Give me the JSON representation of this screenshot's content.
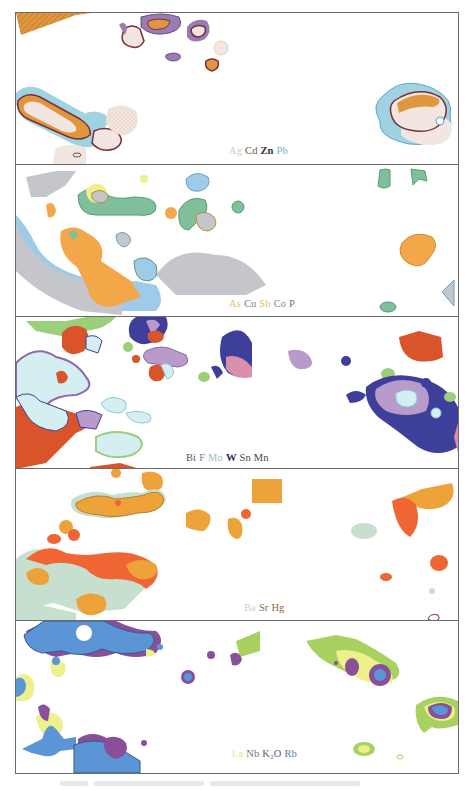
{
  "figure": {
    "panels": [
      {
        "id": "panel-1",
        "legend": [
          {
            "label": "Ag",
            "color": "#d9c9c4"
          },
          {
            "label": "Cd",
            "color": "#6a5a52"
          },
          {
            "label": "Zn",
            "color": "#3d3230"
          },
          {
            "label": "Pb",
            "color": "#6fb3c8"
          }
        ],
        "colors": {
          "orange": "#e0963f",
          "purple": "#9b7bb3",
          "cream": "#f3e5df",
          "cyan": "#9fd3e2",
          "outline": "#7a2d3a"
        }
      },
      {
        "id": "panel-2",
        "legend": [
          {
            "label": "As",
            "color": "#e7c36a"
          },
          {
            "label": "Cu",
            "color": "#7a7f86"
          },
          {
            "label": "Sb",
            "color": "#e3c25a"
          },
          {
            "label": "Co",
            "color": "#7f8a92"
          },
          {
            "label": "P",
            "color": "#6e7378"
          }
        ],
        "colors": {
          "orange": "#f3a748",
          "green": "#7fbf99",
          "gray": "#c4c6cb",
          "blue": "#9dcbe8",
          "yellow": "#eef08a"
        }
      },
      {
        "id": "panel-3",
        "legend": [
          {
            "label": "Bi",
            "color": "#555a6e"
          },
          {
            "label": "F",
            "color": "#6d7f9a"
          },
          {
            "label": "Mo",
            "color": "#9ab8c9"
          },
          {
            "label": "W",
            "color": "#2f2f5a"
          },
          {
            "label": "Sn",
            "color": "#4b3f48"
          },
          {
            "label": "Mn",
            "color": "#4b3f48"
          }
        ],
        "colors": {
          "red": "#d9542a",
          "green": "#9bcf7a",
          "purple": "#b89acb",
          "navy": "#3d3f9a",
          "pink": "#d98fae",
          "lightcyan": "#d5eef2"
        }
      },
      {
        "id": "panel-4",
        "legend": [
          {
            "label": "Ba",
            "color": "#e1cbb8"
          },
          {
            "label": "Sr",
            "color": "#8b6b4a"
          },
          {
            "label": "Hg",
            "color": "#8b6b4a"
          }
        ],
        "colors": {
          "orange": "#eea23a",
          "red": "#ef6634",
          "sage": "#c7dfcf"
        }
      },
      {
        "id": "panel-5",
        "legend": [
          {
            "label": "La",
            "color": "#e6e68c"
          },
          {
            "label": "Nb",
            "color": "#6b7f5a"
          },
          {
            "label": "K₂O",
            "color": "#5a5f7a"
          },
          {
            "label": "Rb",
            "color": "#4f7fb8"
          }
        ],
        "colors": {
          "blue": "#5b95d6",
          "purple": "#8a4f9a",
          "yellow": "#eef08a",
          "green": "#a8d160"
        }
      }
    ]
  }
}
